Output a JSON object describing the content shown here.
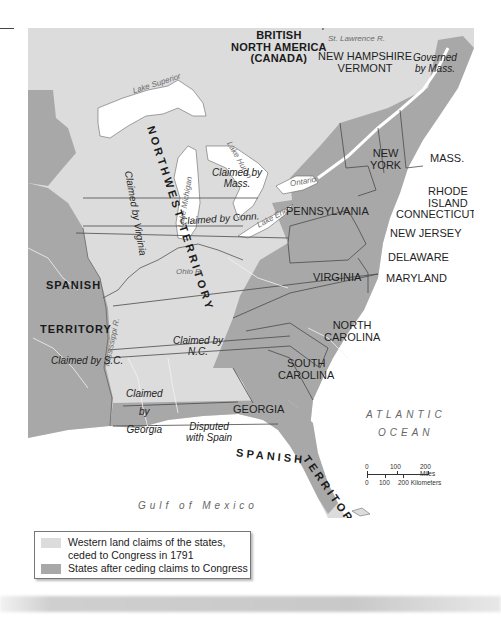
{
  "map": {
    "colors": {
      "water": "#ffffff",
      "western_claims": "#dcdcdc",
      "states": "#a8a8a8",
      "foreign_territory": "#a8a8a8",
      "borders": "#4a4a4a",
      "rivers": "#f0f0f0"
    },
    "regions": {
      "british_north_america": [
        "BRITISH",
        "NORTH AMERICA",
        "(CANADA)"
      ],
      "northwest_territory": "NORTHWEST TERRITORY",
      "spanish_territory_west": [
        "SPANISH",
        "TERRITORY"
      ],
      "spanish_territory_south_1": "SPANISH",
      "spanish_territory_south_2": "TERRITORY"
    },
    "states": {
      "nh_vt": [
        "NEW HAMPSHIRE",
        "VERMONT"
      ],
      "new_york": [
        "NEW",
        "YORK"
      ],
      "mass": "MASS.",
      "rhode_island": [
        "RHODE",
        "ISLAND"
      ],
      "connecticut": "CONNECTICUT",
      "pennsylvania": "PENNSYLVANIA",
      "new_jersey": "NEW JERSEY",
      "delaware": "DELAWARE",
      "maryland": "MARYLAND",
      "virginia": "VIRGINIA",
      "north_carolina": [
        "NORTH",
        "CAROLINA"
      ],
      "south_carolina": [
        "SOUTH",
        "CAROLINA"
      ],
      "georgia": "GEORGIA"
    },
    "claims": {
      "disputed_britain": "Disputed with Britain",
      "governed_by_mass": [
        "Governed",
        "by Mass."
      ],
      "claimed_by_mass": [
        "Claimed by",
        "Mass."
      ],
      "claimed_by_conn": "Claimed by Conn.",
      "claimed_by_virginia": [
        "Claimed",
        "by",
        "Virginia"
      ],
      "claimed_by_nc": [
        "Claimed by",
        "N.C."
      ],
      "claimed_by_sc": "Claimed by S.C.",
      "claimed_by_georgia": [
        "Claimed",
        "by",
        "Georgia"
      ],
      "disputed_spain": [
        "Disputed",
        "with Spain"
      ]
    },
    "water": {
      "lake_superior": "Lake Superior",
      "lake_michigan": "Lake Michigan",
      "lake_huron": "Lake Huron",
      "lake_erie": "Lake Erie",
      "lake_ontario": "Ontario",
      "st_lawrence": "St. Lawrence R.",
      "ohio_river": "Ohio R.",
      "mississippi_river": "Mississippi R.",
      "atlantic": [
        "ATLANTIC",
        "OCEAN"
      ],
      "gulf": "Gulf of Mexico"
    },
    "scale_bar": {
      "miles": [
        "0",
        "100",
        "200 Miles"
      ],
      "kilometers": [
        "0",
        "100",
        "200 Kilometers"
      ]
    }
  },
  "legend": {
    "items": [
      {
        "label_line1": "Western land claims of the states,",
        "label_line2": "ceded to Congress in 1791",
        "color": "#dcdcdc"
      },
      {
        "label_line1": "States after ceding claims to Congress",
        "color": "#a8a8a8"
      }
    ]
  }
}
